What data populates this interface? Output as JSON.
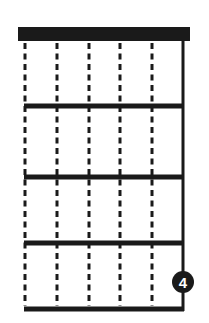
{
  "diagram": {
    "type": "guitar-chord-chart",
    "strings": 6,
    "frets": 4,
    "colors": {
      "ink": "#1a1a1a",
      "background": "#ffffff",
      "marker_text": "#ffffff"
    },
    "open_strings_dashed": [
      1,
      2,
      3,
      4,
      5
    ],
    "solid_strings": [
      6
    ],
    "markers": [
      {
        "string": 6,
        "fret": 4,
        "finger": "4"
      }
    ]
  }
}
